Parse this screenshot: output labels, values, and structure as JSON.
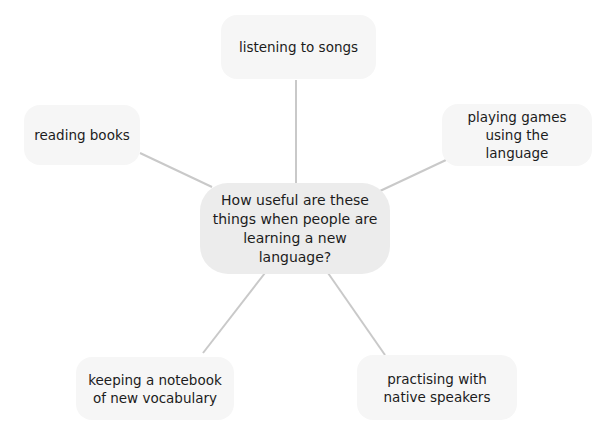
{
  "diagram": {
    "type": "mind-map",
    "colors": {
      "background": "#ffffff",
      "center_fill": "#ececec",
      "node_fill": "#f6f6f6",
      "connector": "#c9c9c9",
      "text": "#1c1c1c"
    },
    "center": {
      "label": "How useful are these things when people are learning a new language?"
    },
    "nodes": [
      {
        "id": "top",
        "label": "listening to songs"
      },
      {
        "id": "left",
        "label": "reading books"
      },
      {
        "id": "right",
        "label": "playing games using the language"
      },
      {
        "id": "bottom-left",
        "label": "keeping a notebook of new vocabulary"
      },
      {
        "id": "bottom-right",
        "label": "practising with native speakers"
      }
    ]
  }
}
